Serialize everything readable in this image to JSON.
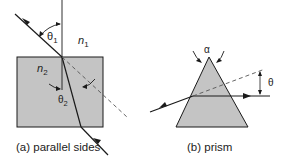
{
  "figure": {
    "colors": {
      "medium_fill": "#c4c4c4",
      "stroke": "#1a1a1a",
      "background": "#ffffff"
    },
    "panel_a": {
      "caption": "(a) parallel sides",
      "labels": {
        "theta1": "θ",
        "theta1_sub": "1",
        "n1": "n",
        "n1_sub": "1",
        "n2": "n",
        "n2_sub": "2",
        "theta2": "θ",
        "theta2_sub": "2"
      }
    },
    "panel_b": {
      "caption": "(b) prism",
      "labels": {
        "alpha": "α",
        "theta": "θ"
      }
    }
  }
}
